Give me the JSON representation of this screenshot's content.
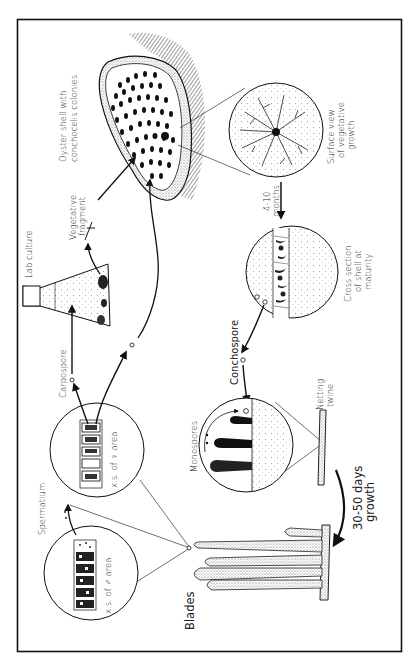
{
  "figure": {
    "orientation": "rotated-90-ccw",
    "border_color": "#111111",
    "background": "#ffffff"
  },
  "labels": {
    "oyster_shell": [
      "Oyster shell with",
      "conchocelis colonies"
    ],
    "surface_view": [
      "Surface view",
      "of vegetative",
      "growth"
    ],
    "months": [
      "4-10",
      "months"
    ],
    "cross_section": [
      "Cross section",
      "of shell at",
      "maturity"
    ],
    "vegetative_fragment": [
      "Vegetative",
      "fragment"
    ],
    "lab_culture": "Lab culture",
    "carpospore": "Carpospore",
    "conchospore": "Conchospore",
    "monospores": "Monospores",
    "netting_twine": [
      "Netting",
      "twine"
    ],
    "growth_period": [
      "30-50 days",
      "growth"
    ],
    "xs_female": "x.s. of ♀ area",
    "xs_male": "x.s. of ♂ area",
    "spermatium": "Spermatium",
    "blades": "Blades"
  },
  "stages": [
    "Blades",
    "Spermatium",
    "Carpospore",
    "Lab culture",
    "Vegetative fragment",
    "Oyster shell with conchocelis colonies",
    "Surface view of vegetative growth",
    "Cross section of shell at maturity",
    "Conchospore",
    "Monospores",
    "Netting twine"
  ]
}
